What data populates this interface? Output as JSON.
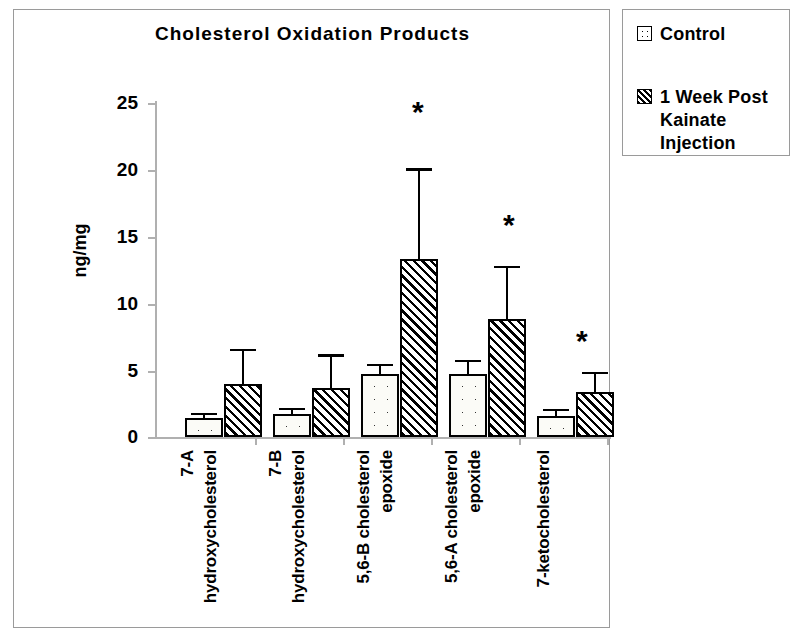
{
  "chart_data": {
    "type": "bar",
    "title": "Cholesterol Oxidation Products",
    "xlabel": "",
    "ylabel": "ng/mg",
    "ylim": [
      0,
      25
    ],
    "yticks": [
      0,
      5,
      10,
      15,
      20,
      25
    ],
    "ytick_labels": [
      "0",
      "5",
      "10",
      "15",
      "20",
      "25"
    ],
    "grid": false,
    "legend_position": "outside-top-right",
    "categories": [
      "7-A hydroxycholesterol",
      "7-B hydroxycholesterol",
      "5,6-B cholesterol epoxide",
      "5,6-A cholesterol epoxide",
      "7-ketocholesterol"
    ],
    "category_lines": [
      [
        "7-A",
        "hydroxycholesterol"
      ],
      [
        "7-B",
        "hydroxycholesterol"
      ],
      [
        "5,6-B cholesterol",
        "epoxide"
      ],
      [
        "5,6-A cholesterol",
        "epoxide"
      ],
      [
        "7-ketocholesterol"
      ]
    ],
    "series": [
      {
        "name": "Control",
        "pattern": "dotted",
        "values": [
          1.4,
          1.7,
          4.7,
          4.7,
          1.6
        ],
        "errors": [
          0.4,
          0.5,
          0.8,
          1.1,
          0.5
        ]
      },
      {
        "name": "1 Week Post Kainate Injection",
        "pattern": "hatched",
        "values": [
          4.0,
          3.7,
          13.3,
          8.8,
          3.4
        ],
        "errors": [
          2.6,
          2.5,
          6.8,
          4.0,
          1.5
        ]
      }
    ],
    "annotations": [
      {
        "label": "*",
        "category": "5,6-B cholesterol epoxide",
        "meaning": "significant"
      },
      {
        "label": "*",
        "category": "5,6-A cholesterol epoxide",
        "meaning": "significant"
      },
      {
        "label": "*",
        "category": "7-ketocholesterol",
        "meaning": "significant"
      }
    ]
  },
  "legend": {
    "items": [
      {
        "label": "Control",
        "swatch": "dotted-square-icon"
      },
      {
        "label": "1 Week Post Kainate Injection",
        "swatch": "hatched-square-icon"
      }
    ],
    "item0_label": "Control",
    "item1_line0": "1 Week Post",
    "item1_line1": "Kainate",
    "item1_line2": "Injection"
  },
  "axis": {
    "y_title": "ng/mg",
    "tick0": "0",
    "tick1": "5",
    "tick2": "10",
    "tick3": "15",
    "tick4": "20",
    "tick5": "25"
  },
  "labels": {
    "g0_l0": "7-A",
    "g0_l1": "hydroxycholesterol",
    "g1_l0": "7-B",
    "g1_l1": "hydroxycholesterol",
    "g2_l0": "5,6-B cholesterol",
    "g2_l1": "epoxide",
    "g3_l0": "5,6-A cholesterol",
    "g3_l1": "epoxide",
    "g4_l0": "7-ketocholesterol"
  },
  "annotations": {
    "star0": "*",
    "star1": "*",
    "star2": "*"
  },
  "colors": {
    "ink": "#000000",
    "axis": "#b0b0b0",
    "frame": "#9a9a9a",
    "background": "#ffffff"
  }
}
